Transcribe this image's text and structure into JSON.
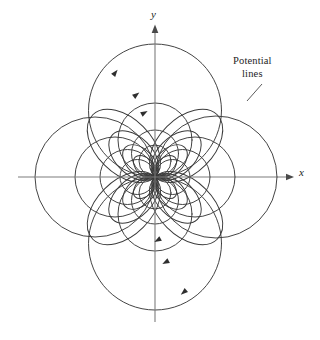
{
  "figure": {
    "kind": "field-map-diagram",
    "background_color": "#ffffff",
    "curve_color": "#3a3a3a",
    "axis_color": "#7d7d7d",
    "text_color": "#1d1d1d"
  },
  "axes": {
    "origin": {
      "x": 155,
      "y": 177
    },
    "x_axis": {
      "label": "x",
      "label_x": 299,
      "label_y": 176,
      "start_x": 18,
      "end_x": 290,
      "y": 177,
      "arrow": "right"
    },
    "y_axis": {
      "label": "y",
      "label_x": 151,
      "label_y": 18,
      "start_y": 322,
      "end_y": 29,
      "x": 155,
      "arrow": "up"
    }
  },
  "callout": {
    "name": "potential-lines-callout",
    "line1": "Potential",
    "line2": "lines",
    "leader": {
      "x1": 262,
      "y1": 84,
      "x2": 247,
      "y2": 101
    }
  },
  "chart_data": {
    "type": "line",
    "title": "",
    "xlabel": "x",
    "ylabel": "y",
    "grid": false,
    "legend": "none",
    "origin": {
      "x": 155,
      "y": 177
    },
    "note": "Families of circles all tangent at the origin; radii measured in pixels from origin along each axis direction",
    "circle_families": [
      {
        "name": "east-lobes",
        "direction": "+x",
        "axis_crossings": [
          190,
          210,
          235,
          277
        ],
        "radii": [
          17.5,
          27.5,
          40,
          61
        ]
      },
      {
        "name": "west-lobes",
        "direction": "-x",
        "axis_crossings": [
          120,
          100,
          75,
          35
        ],
        "radii": [
          17.5,
          27.5,
          40,
          60
        ]
      },
      {
        "name": "north-lobes",
        "direction": "+y",
        "axis_crossings": [
          145,
          130,
          103,
          44
        ],
        "radii": [
          16,
          23.5,
          37,
          66.5
        ]
      },
      {
        "name": "south-lobes",
        "direction": "-y",
        "axis_crossings": [
          209,
          224,
          251,
          310
        ],
        "radii": [
          16,
          23.5,
          37,
          66.5
        ]
      }
    ],
    "direction_arrows": [
      {
        "x": 115,
        "y": 73,
        "angle": -52
      },
      {
        "x": 136,
        "y": 95,
        "angle": -38
      },
      {
        "x": 144,
        "y": 113,
        "angle": -30
      },
      {
        "x": 158,
        "y": 240,
        "angle": 150
      },
      {
        "x": 166,
        "y": 262,
        "angle": 152
      },
      {
        "x": 184,
        "y": 292,
        "angle": 140
      }
    ]
  }
}
